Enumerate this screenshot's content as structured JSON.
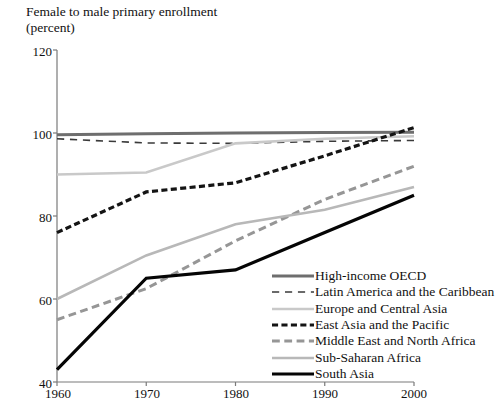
{
  "chart_data": {
    "type": "line",
    "title": "Female to male primary enrollment",
    "subtitle": "(percent)",
    "xlabel": "",
    "ylabel": "",
    "x": [
      1960,
      1970,
      1980,
      1990,
      2000
    ],
    "xlim": [
      1960,
      2000
    ],
    "ylim": [
      40,
      120
    ],
    "xticks": [
      "1960",
      "1970",
      "1980",
      "1990",
      "2000"
    ],
    "yticks": [
      "40",
      "60",
      "80",
      "100",
      "120"
    ],
    "grid": false,
    "legend_position": "inside-bottom-right",
    "series": [
      {
        "name": "High-income OECD",
        "values": [
          99.6,
          99.8,
          100.0,
          100.1,
          100.2
        ],
        "color": "#6e6e6e",
        "style": "solid",
        "width": 3.0
      },
      {
        "name": "Latin America and the Caribbean",
        "values": [
          98.6,
          97.6,
          97.5,
          98.0,
          98.2
        ],
        "color": "#3a3a3a",
        "style": "dashed-long",
        "width": 1.6
      },
      {
        "name": "Europe and Central Asia",
        "values": [
          90.0,
          90.5,
          97.5,
          98.6,
          99.2
        ],
        "color": "#c9c9c9",
        "style": "solid",
        "width": 2.6
      },
      {
        "name": "East Asia and the Pacific",
        "values": [
          76.0,
          85.8,
          88.0,
          94.5,
          101.3
        ],
        "color": "#141414",
        "style": "dashed-thick",
        "width": 3.2
      },
      {
        "name": "Middle East and North Africa",
        "values": [
          55.0,
          62.5,
          74.0,
          84.0,
          92.0
        ],
        "color": "#969696",
        "style": "dashed-med",
        "width": 3.0
      },
      {
        "name": "Sub-Saharan Africa",
        "values": [
          60.0,
          70.5,
          78.0,
          81.5,
          87.0
        ],
        "color": "#b8b8b8",
        "style": "solid",
        "width": 2.6
      },
      {
        "name": "South Asia",
        "values": [
          43.0,
          65.0,
          67.0,
          76.0,
          85.0
        ],
        "color": "#050505",
        "style": "solid",
        "width": 3.2
      }
    ]
  },
  "legend": {
    "items": [
      {
        "label": "High-income OECD"
      },
      {
        "label": "Latin America and the Caribbean"
      },
      {
        "label": "Europe and Central Asia"
      },
      {
        "label": "East Asia and the Pacific"
      },
      {
        "label": "Middle East and North Africa"
      },
      {
        "label": "Sub-Saharan Africa"
      },
      {
        "label": "South Asia"
      }
    ]
  },
  "axis": {
    "color": "#7a7a7a"
  }
}
